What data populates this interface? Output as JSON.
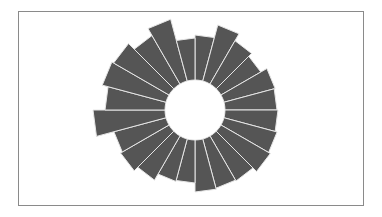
{
  "chart_data": {
    "type": "bar",
    "subtype": "radial",
    "title": "",
    "xlabel": "",
    "ylabel": "",
    "grid": false,
    "legend": null,
    "bar_count": 24,
    "start_angle_deg": 0,
    "direction": "clockwise",
    "inner_radius": 30,
    "categories": [
      "1",
      "2",
      "3",
      "4",
      "5",
      "6",
      "7",
      "8",
      "9",
      "10",
      "11",
      "12",
      "13",
      "14",
      "15",
      "16",
      "17",
      "18",
      "19",
      "20",
      "21",
      "22",
      "23",
      "24"
    ],
    "values": [
      45,
      58,
      50,
      46,
      53,
      52,
      53,
      55,
      57,
      52,
      51,
      52,
      43,
      44,
      51,
      56,
      54,
      72,
      60,
      66,
      64,
      56,
      64,
      42
    ],
    "ylim": [
      0,
      75
    ]
  },
  "style": {
    "bar_color": "#555555",
    "gap_color": "#e6e6e6",
    "frame_color": "#8a8a8a",
    "background": "#ffffff"
  },
  "layout": {
    "center_x": 195,
    "center_y": 110
  }
}
